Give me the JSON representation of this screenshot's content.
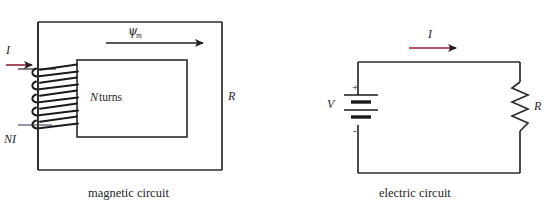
{
  "figure": {
    "background_color": "#ffffff",
    "line_color": "#2b2b2b",
    "arrow_color": "#8e2135",
    "lead_color": "#7b6f96",
    "text_color": "#262626"
  },
  "magnetic_circuit": {
    "caption": "magnetic circuit",
    "flux_symbol": "ψ",
    "flux_subscript": "m",
    "current_label": "I",
    "mmf_label": "NI",
    "turns_label_symbol": "N",
    "turns_label_text": "turns",
    "turns_label_full": "N turns",
    "reluctance_label": "R",
    "coil_turns_drawn": 5,
    "flux_arrow_direction": "right",
    "current_arrow_direction": "right"
  },
  "electric_circuit": {
    "caption": "electric circuit",
    "current_label": "I",
    "voltage_label": "V",
    "plus_sign": "+",
    "minus_sign": "-",
    "resistor_label": "R",
    "battery_cells": 2,
    "resistor_zigzag_peaks": 5,
    "current_arrow_direction": "right"
  }
}
